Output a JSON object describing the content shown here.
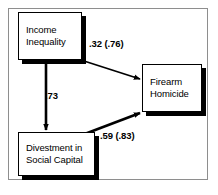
{
  "figure": {
    "type": "path-diagram",
    "background_color": "#ffffff",
    "frame_color": "#8e8e8e",
    "line_color": "#000000"
  },
  "nodes": [
    {
      "id": "income-inequality",
      "line1": "Income",
      "line2": "Inequality"
    },
    {
      "id": "firearm-homicide",
      "line1": "Firearm",
      "line2": "Homicide"
    },
    {
      "id": "divestment-social-capital",
      "line1": "Divestment in",
      "line2": "Social Capital"
    }
  ],
  "paths": [
    {
      "id": "income-to-firearm",
      "label": ".32  (.76)",
      "coefficient": ".32",
      "coefficient_parenthetical": "(.76)",
      "from": "income-inequality",
      "to": "firearm-homicide"
    },
    {
      "id": "income-to-divestment",
      "label": ".73",
      "coefficient": ".73",
      "coefficient_parenthetical": "",
      "from": "income-inequality",
      "to": "divestment-social-capital"
    },
    {
      "id": "divestment-to-firearm",
      "label": ".59  (.83)",
      "coefficient": ".59",
      "coefficient_parenthetical": "(.83)",
      "from": "divestment-social-capital",
      "to": "firearm-homicide"
    }
  ]
}
